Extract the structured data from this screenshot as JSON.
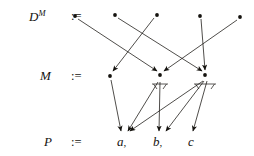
{
  "figure": {
    "width": 254,
    "height": 156,
    "background": "#ffffff",
    "ink": "#15130f"
  },
  "rows": {
    "top": {
      "label_base": "D",
      "label_sup": "M",
      "assign": ":=",
      "nodes": [
        {
          "id": "d1",
          "x": 75,
          "y": 16
        },
        {
          "id": "d2",
          "x": 115,
          "y": 15
        },
        {
          "id": "d3",
          "x": 157,
          "y": 15
        },
        {
          "id": "d4",
          "x": 200,
          "y": 16
        },
        {
          "id": "d5",
          "x": 240,
          "y": 17
        }
      ]
    },
    "middle": {
      "label_base": "M",
      "assign": ":=",
      "nodes": [
        {
          "id": "m1",
          "x": 110,
          "y": 76
        },
        {
          "id": "m2",
          "x": 160,
          "y": 75
        },
        {
          "id": "m3",
          "x": 205,
          "y": 75
        }
      ]
    },
    "bottom": {
      "label_base": "P",
      "assign": ":=",
      "terms": [
        {
          "id": "p_a",
          "text": "a",
          "punct": ",",
          "x": 122,
          "y": 143
        },
        {
          "id": "p_b",
          "text": "b",
          "punct": ",",
          "x": 158,
          "y": 143
        },
        {
          "id": "p_c",
          "text": "c",
          "punct": "",
          "x": 190,
          "y": 143
        }
      ]
    }
  },
  "edges": {
    "top_to_middle": [
      {
        "from": "d1",
        "to": "m2",
        "x1": 78,
        "y1": 19,
        "x2": 157,
        "y2": 71
      },
      {
        "from": "d2",
        "to": "m3",
        "x1": 118,
        "y1": 18,
        "x2": 202,
        "y2": 71
      },
      {
        "from": "d3",
        "to": "m1",
        "x1": 154,
        "y1": 18,
        "x2": 113,
        "y2": 71
      },
      {
        "from": "d4",
        "to": "m3",
        "x1": 201,
        "y1": 19,
        "x2": 205,
        "y2": 70
      },
      {
        "from": "d5",
        "to": "m2",
        "x1": 237,
        "y1": 20,
        "x2": 164,
        "y2": 71
      }
    ],
    "middle_to_bottom": [
      {
        "from": "m1",
        "to": "p_a",
        "x1": 111,
        "y1": 80,
        "x2": 121,
        "y2": 131
      },
      {
        "from": "m2",
        "to": "p_b",
        "x1": 160,
        "y1": 82,
        "x2": 159,
        "y2": 131
      },
      {
        "from": "m2",
        "to": "p_a",
        "x1": 158,
        "y1": 82,
        "x2": 128,
        "y2": 131
      },
      {
        "from": "m3",
        "to": "p_a",
        "x1": 203,
        "y1": 81,
        "x2": 130,
        "y2": 131
      },
      {
        "from": "m3",
        "to": "p_b",
        "x1": 204,
        "y1": 81,
        "x2": 166,
        "y2": 131
      },
      {
        "from": "m3",
        "to": "p_c",
        "x1": 207,
        "y1": 81,
        "x2": 193,
        "y2": 131
      }
    ]
  },
  "braces": [
    {
      "under": "m2",
      "x": 160,
      "y": 84,
      "width": 16
    },
    {
      "under": "m3",
      "x": 205,
      "y": 84,
      "width": 22
    }
  ]
}
